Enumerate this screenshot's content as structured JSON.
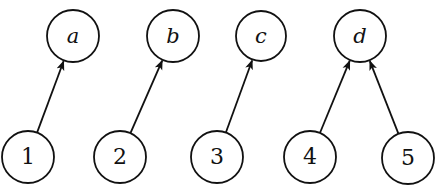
{
  "diagram": {
    "type": "directed-graph",
    "colors": {
      "stroke": "#111111",
      "background": "#ffffff"
    },
    "top_nodes": [
      {
        "id": "a",
        "label": "a",
        "cx": 73,
        "cy": 36,
        "r": 26
      },
      {
        "id": "b",
        "label": "b",
        "cx": 173,
        "cy": 36,
        "r": 26
      },
      {
        "id": "c",
        "label": "c",
        "cx": 261,
        "cy": 36,
        "r": 25
      },
      {
        "id": "d",
        "label": "d",
        "cx": 360,
        "cy": 36,
        "r": 26
      }
    ],
    "bottom_nodes": [
      {
        "id": "1",
        "label": "1",
        "cx": 28,
        "cy": 157,
        "r": 26
      },
      {
        "id": "2",
        "label": "2",
        "cx": 120,
        "cy": 157,
        "r": 26
      },
      {
        "id": "3",
        "label": "3",
        "cx": 217,
        "cy": 157,
        "r": 26
      },
      {
        "id": "4",
        "label": "4",
        "cx": 310,
        "cy": 157,
        "r": 26
      },
      {
        "id": "5",
        "label": "5",
        "cx": 408,
        "cy": 158,
        "r": 26
      }
    ],
    "edges": [
      {
        "from": "1",
        "to": "a"
      },
      {
        "from": "2",
        "to": "b"
      },
      {
        "from": "3",
        "to": "c"
      },
      {
        "from": "4",
        "to": "d"
      },
      {
        "from": "5",
        "to": "d"
      }
    ]
  }
}
